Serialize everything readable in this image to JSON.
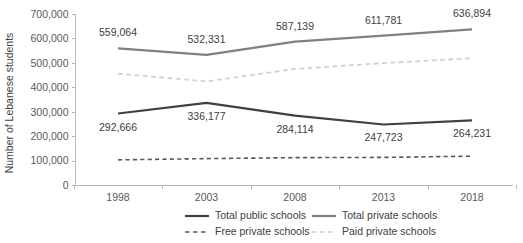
{
  "chart_data": {
    "type": "line",
    "title": "",
    "xlabel": "",
    "ylabel": "Number of Lebanese students",
    "categories": [
      "1998",
      "2003",
      "2008",
      "2013",
      "2018"
    ],
    "ylim": [
      0,
      700000
    ],
    "ytick_values": [
      0,
      100000,
      200000,
      300000,
      400000,
      500000,
      600000,
      700000
    ],
    "ytick_labels": [
      "0",
      "100,000",
      "200,000",
      "300,000",
      "400,000",
      "500,000",
      "600,000",
      "700,000"
    ],
    "grid": false,
    "legend_position": "bottom",
    "series": [
      {
        "name": "Total public schools",
        "style": "solid",
        "color": "#404040",
        "width": 2.2,
        "values": [
          292666,
          336177,
          284114,
          247723,
          264231
        ],
        "labels": [
          "292,666",
          "336,177",
          "284,114",
          "247,723",
          "264,231"
        ],
        "labels_shown": true
      },
      {
        "name": "Total private schools",
        "style": "solid",
        "color": "#808080",
        "width": 2.2,
        "values": [
          559064,
          532331,
          587139,
          611781,
          636894
        ],
        "labels": [
          "559,064",
          "532,331",
          "587,139",
          "611,781",
          "636,894"
        ],
        "labels_shown": true
      },
      {
        "name": "Free private schools",
        "style": "dashed",
        "color": "#595959",
        "width": 1.6,
        "values": [
          103000,
          108000,
          112000,
          113000,
          118000
        ],
        "labels": [
          "",
          "",
          "",
          "",
          ""
        ],
        "labels_shown": false
      },
      {
        "name": "Paid private schools",
        "style": "dashed",
        "color": "#d0d0d0",
        "width": 1.8,
        "values": [
          456000,
          424000,
          475000,
          499000,
          519000
        ],
        "labels": [
          "",
          "",
          "",
          "",
          ""
        ],
        "labels_shown": false
      }
    ],
    "legend_entries": [
      {
        "label": "Total public schools",
        "style": "solid",
        "color": "#404040"
      },
      {
        "label": "Total private schools",
        "style": "solid",
        "color": "#808080"
      },
      {
        "label": "Free private schools",
        "style": "dashed",
        "color": "#595959"
      },
      {
        "label": "Paid private schools",
        "style": "dashed",
        "color": "#d0d0d0"
      }
    ]
  }
}
